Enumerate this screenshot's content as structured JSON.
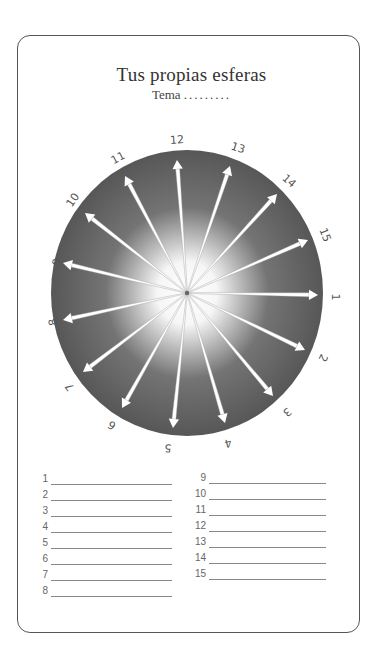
{
  "header": {
    "title": "Tus propias esferas",
    "subtitle_label": "Tema",
    "subtitle_dots": "........."
  },
  "sphere": {
    "center": [
      187,
      293
    ],
    "rx": 136,
    "ry": 143,
    "outer_color": "#5a5a5a",
    "inner_color": "#ffffff",
    "spokes": [
      {
        "label": "1",
        "tip": [
          318,
          295
        ],
        "label_pos": [
          335,
          297
        ],
        "rot": 90
      },
      {
        "label": "2",
        "tip": [
          305,
          350
        ],
        "label_pos": [
          323,
          358
        ],
        "rot": 115
      },
      {
        "label": "3",
        "tip": [
          273,
          396
        ],
        "label_pos": [
          287,
          412
        ],
        "rot": 140
      },
      {
        "label": "4",
        "tip": [
          225,
          423
        ],
        "label_pos": [
          228,
          443
        ],
        "rot": 165
      },
      {
        "label": "5",
        "tip": [
          173,
          428
        ],
        "label_pos": [
          168,
          448
        ],
        "rot": 185
      },
      {
        "label": "6",
        "tip": [
          122,
          408
        ],
        "label_pos": [
          112,
          425
        ],
        "rot": 210
      },
      {
        "label": "7",
        "tip": [
          83,
          372
        ],
        "label_pos": [
          70,
          387
        ],
        "rot": 235
      },
      {
        "label": "8",
        "tip": [
          63,
          320
        ],
        "label_pos": [
          53,
          322
        ],
        "rot": 258
      },
      {
        "label": "9",
        "tip": [
          63,
          263
        ],
        "label_pos": [
          57,
          262
        ],
        "rot": 283
      },
      {
        "label": "10",
        "tip": [
          85,
          213
        ],
        "label_pos": [
          73,
          200
        ],
        "rot": 305
      },
      {
        "label": "11",
        "tip": [
          125,
          176
        ],
        "label_pos": [
          118,
          158
        ],
        "rot": 332
      },
      {
        "label": "12",
        "tip": [
          177,
          160
        ],
        "label_pos": [
          177,
          140
        ],
        "rot": 356
      },
      {
        "label": "13",
        "tip": [
          230,
          166
        ],
        "label_pos": [
          238,
          148
        ],
        "rot": 18
      },
      {
        "label": "14",
        "tip": [
          277,
          194
        ],
        "label_pos": [
          289,
          181
        ],
        "rot": 42
      },
      {
        "label": "15",
        "tip": [
          308,
          240
        ],
        "label_pos": [
          325,
          235
        ],
        "rot": 68
      }
    ]
  },
  "list": {
    "left": [
      "1",
      "2",
      "3",
      "4",
      "5",
      "6",
      "7",
      "8"
    ],
    "right": [
      "9",
      "10",
      "11",
      "12",
      "13",
      "14",
      "15"
    ]
  }
}
